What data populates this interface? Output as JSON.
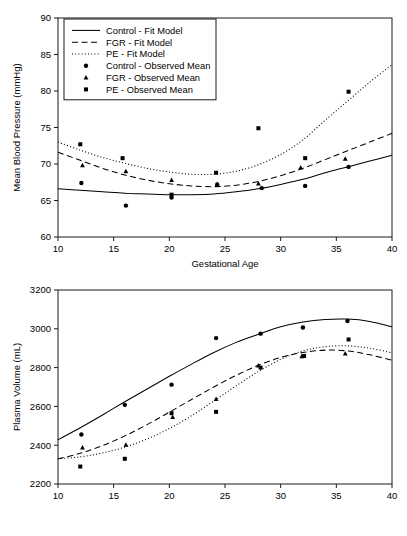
{
  "figure": {
    "background": "#ffffff",
    "ink": "#000000",
    "panels": [
      "blood-pressure",
      "plasma-volume"
    ]
  },
  "legend": {
    "position": "top-left",
    "items": [
      {
        "label": "Control - Fit Model",
        "glyph": "line-solid",
        "series": "control",
        "kind": "fit"
      },
      {
        "label": "FGR - Fit Model",
        "glyph": "line-dashed",
        "series": "fgr",
        "kind": "fit"
      },
      {
        "label": "PE - Fit Model",
        "glyph": "line-dotted",
        "series": "pe",
        "kind": "fit"
      },
      {
        "label": "Control - Observed Mean",
        "glyph": "marker-circle",
        "series": "control",
        "kind": "observed"
      },
      {
        "label": "FGR - Observed Mean",
        "glyph": "marker-triangle",
        "series": "fgr",
        "kind": "observed"
      },
      {
        "label": "PE - Observed Mean",
        "glyph": "marker-square",
        "series": "pe",
        "kind": "observed"
      }
    ]
  },
  "chart_data": [
    {
      "id": "blood-pressure",
      "type": "line",
      "title": "",
      "xlabel": "Gestational Age",
      "ylabel": "Mean Blood Pressure (mmHg)",
      "xlim": [
        10,
        40
      ],
      "ylim": [
        60,
        90
      ],
      "xticks": [
        10,
        15,
        20,
        25,
        30,
        35,
        40
      ],
      "yticks": [
        60,
        65,
        70,
        75,
        80,
        85,
        90
      ],
      "grid": false,
      "legend_position": "top-left",
      "series": [
        {
          "name": "Control - Fit Model",
          "key": "control-fit",
          "style": "solid",
          "marker": "none",
          "x": [
            10,
            12,
            14,
            16,
            18,
            20,
            22,
            24,
            26,
            28,
            30,
            32,
            34,
            36,
            38,
            40
          ],
          "y": [
            66.6,
            66.4,
            66.2,
            66.0,
            65.9,
            65.8,
            65.8,
            65.9,
            66.2,
            66.6,
            67.2,
            67.9,
            68.8,
            69.6,
            70.4,
            71.2
          ]
        },
        {
          "name": "FGR - Fit Model",
          "key": "fgr-fit",
          "style": "dashed",
          "marker": "none",
          "x": [
            10,
            12,
            14,
            16,
            18,
            20,
            22,
            24,
            26,
            28,
            30,
            32,
            34,
            36,
            38,
            40
          ],
          "y": [
            71.6,
            70.5,
            69.4,
            68.5,
            67.8,
            67.3,
            67.0,
            66.9,
            67.1,
            67.6,
            68.4,
            69.4,
            70.6,
            71.8,
            73.0,
            74.2
          ]
        },
        {
          "name": "PE - Fit Model",
          "key": "pe-fit",
          "style": "dotted",
          "marker": "none",
          "x": [
            10,
            12,
            14,
            16,
            18,
            20,
            22,
            24,
            26,
            28,
            30,
            32,
            34,
            36,
            38,
            40
          ],
          "y": [
            73.0,
            71.9,
            70.9,
            70.1,
            69.4,
            68.9,
            68.6,
            68.6,
            69.0,
            69.9,
            71.3,
            73.3,
            76.0,
            78.6,
            81.2,
            83.6
          ]
        },
        {
          "name": "Control - Observed Mean",
          "key": "control-obs",
          "style": "none",
          "marker": "circle",
          "x": [
            12.1,
            16.1,
            20.2,
            24.3,
            28.3,
            32.2,
            36.1
          ],
          "y": [
            67.4,
            64.3,
            65.4,
            67.2,
            66.7,
            67.0,
            69.6
          ]
        },
        {
          "name": "FGR - Observed Mean",
          "key": "fgr-obs",
          "style": "none",
          "marker": "triangle",
          "x": [
            12.2,
            16.1,
            20.2,
            24.3,
            28.0,
            31.8,
            35.8
          ],
          "y": [
            69.8,
            69.0,
            67.8,
            67.2,
            67.3,
            69.5,
            70.7
          ]
        },
        {
          "name": "PE - Observed Mean",
          "key": "pe-obs",
          "style": "none",
          "marker": "square",
          "x": [
            12.0,
            15.8,
            20.2,
            24.2,
            28.0,
            32.2,
            36.1
          ],
          "y": [
            72.7,
            70.8,
            65.8,
            68.8,
            74.9,
            70.8,
            79.9
          ]
        }
      ]
    },
    {
      "id": "plasma-volume",
      "type": "line",
      "title": "",
      "xlabel": "",
      "ylabel": "Plasma Volume (mL)",
      "xlim": [
        10,
        40
      ],
      "ylim": [
        2200,
        3200
      ],
      "xticks": [
        10,
        15,
        20,
        25,
        30,
        35,
        40
      ],
      "yticks": [
        2200,
        2400,
        2600,
        2800,
        3000,
        3200
      ],
      "grid": false,
      "legend_position": "none",
      "series": [
        {
          "name": "Control - Fit Model",
          "key": "control-fit",
          "style": "solid",
          "marker": "none",
          "x": [
            10,
            12,
            14,
            16,
            18,
            20,
            22,
            24,
            26,
            28,
            30,
            32,
            34,
            36,
            38,
            40
          ],
          "y": [
            2428,
            2490,
            2556,
            2624,
            2690,
            2755,
            2818,
            2878,
            2930,
            2972,
            3010,
            3035,
            3048,
            3050,
            3038,
            3010
          ]
        },
        {
          "name": "FGR - Fit Model",
          "key": "fgr-fit",
          "style": "dashed",
          "marker": "none",
          "x": [
            10,
            12,
            14,
            16,
            18,
            20,
            22,
            24,
            26,
            28,
            30,
            32,
            34,
            36,
            38,
            40
          ],
          "y": [
            2330,
            2358,
            2398,
            2448,
            2506,
            2570,
            2636,
            2700,
            2760,
            2812,
            2852,
            2878,
            2890,
            2886,
            2866,
            2838
          ]
        },
        {
          "name": "PE - Fit Model",
          "key": "pe-fit",
          "style": "dotted",
          "marker": "none",
          "x": [
            10,
            12,
            14,
            16,
            18,
            20,
            22,
            24,
            26,
            28,
            30,
            32,
            34,
            36,
            38,
            40
          ],
          "y": [
            2330,
            2340,
            2360,
            2390,
            2432,
            2486,
            2552,
            2628,
            2706,
            2780,
            2842,
            2886,
            2908,
            2912,
            2900,
            2876
          ]
        },
        {
          "name": "Control - Observed Mean",
          "key": "control-obs",
          "style": "none",
          "marker": "circle",
          "x": [
            12.1,
            16.0,
            20.2,
            24.2,
            28.2,
            32.0,
            36.0
          ],
          "y": [
            2455,
            2608,
            2712,
            2952,
            2975,
            3007,
            3040
          ]
        },
        {
          "name": "FGR - Observed Mean",
          "key": "fgr-obs",
          "style": "none",
          "marker": "triangle",
          "x": [
            12.2,
            16.1,
            20.3,
            24.2,
            28.0,
            31.9,
            35.8
          ],
          "y": [
            2388,
            2402,
            2545,
            2638,
            2810,
            2858,
            2872
          ]
        },
        {
          "name": "PE - Observed Mean",
          "key": "pe-obs",
          "style": "none",
          "marker": "square",
          "x": [
            12.0,
            16.0,
            20.2,
            24.2,
            28.2,
            32.1,
            36.1
          ],
          "y": [
            2290,
            2330,
            2565,
            2572,
            2800,
            2860,
            2945
          ]
        }
      ]
    }
  ]
}
